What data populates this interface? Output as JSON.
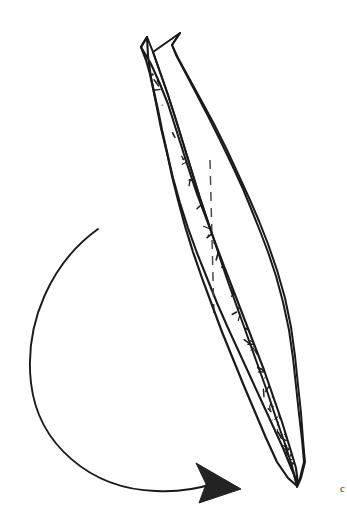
{
  "figure": {
    "background_color": "#ffffff",
    "ink_color": "#1a1a1a",
    "width": 347,
    "height": 532,
    "caption_fragment": "c",
    "parts": [
      {
        "name": "stippled-blade",
        "label": "Stippled elongated blade, two pointed tips at top converging to single point at base",
        "fill_color": "#ffffff",
        "stroke_color": "#1a1a1a"
      },
      {
        "name": "rear-blade-facet",
        "label": "Unstippled rear facet band along right margin",
        "fill_color": "#ffffff",
        "stroke_color": "#1a1a1a"
      },
      {
        "name": "rotation-arrow",
        "label": "Counterclockwise rotation arc with solid triangular arrowhead",
        "stroke_color": "#1a1a1a",
        "arrowhead_color": "#232323"
      },
      {
        "name": "midline-dashed",
        "label": "Dashed central axis line",
        "stroke_color": "#4a4a4a"
      }
    ]
  },
  "geometry": {
    "blade_outline_path": "M 147 37 L 141 47 L 151 64 L 160 84 L 168 104 L 175 126 L 182 148 L 189 170 L 197 194 L 206 218 L 215 242 L 224 266 L 234 292 L 244 318 L 254 344 L 264 370 L 273 396 L 282 422 L 290 448 L 296 468 L 298 484 L 292 470 L 283 448 L 272 424 L 261 400 L 250 376 L 239 352 L 228 328 L 217 303 L 207 278 L 197 253 L 188 228 L 180 203 L 173 178 L 167 153 L 161 128 L 156 103 L 151 78 L 148 56 Z",
    "blade_left_edge": "M 147 37 L 141 47 L 146 60 L 150 74 L 154 92 L 158 110 L 162 130 L 167 152 L 172 176 L 178 200 L 185 226 L 193 252 L 202 278 L 212 305 L 222 332 L 233 359 L 244 386 L 255 412 L 266 438 L 277 462 L 288 478 L 297 486",
    "blade_right_edge": "M 147 37 L 153 52 L 160 72 L 168 95 L 176 120 L 184 146 L 192 172 L 200 198 L 209 225 L 218 252 L 227 279 L 237 307 L 247 335 L 257 363 L 267 391 L 276 418 L 285 444 L 292 466 L 297 486",
    "rear_facet_path": "M 180 33 L 172 45 L 176 55 L 185 72 L 196 93 L 208 116 L 220 140 L 232 165 L 243 189 L 252 211 L 260 231 L 268 252 L 276 276 L 283 302 L 289 330 L 293 358 L 296 386 L 299 414 L 302 440 L 304 462 L 300 478 L 297 486 L 292 466 L 285 444 L 276 418 L 267 391 L 257 363 L 247 335 L 237 307 L 227 279 L 218 252 L 209 225 L 200 198 L 192 172 L 184 146 L 176 120 L 168 95 L 160 72 L 153 52 Z",
    "rear_outer_edge": "M 180 33 L 172 45 L 178 58 L 189 78 L 201 100 L 214 124 L 227 150 L 239 176 L 250 200 L 259 221 L 268 244 L 277 270 L 285 298 L 291 327 L 295 356 L 298 385 L 301 413 L 303 440 L 305 462 L 301 478 L 297 487",
    "rotation_arc": "M 98 229 C 52 262 24 322 31 383 C 38 444 90 489 156 491 C 178 492 197 489 212 484",
    "arrowhead_points": "196,463 241,489 199,503 206,484",
    "midline": "M 210 160 L 214 316"
  },
  "texture": {
    "description": "Hand-drawn stipple of short dashes and dots filling the blade interior",
    "mark_count": 300,
    "mark_color": "#1f1f1f"
  }
}
